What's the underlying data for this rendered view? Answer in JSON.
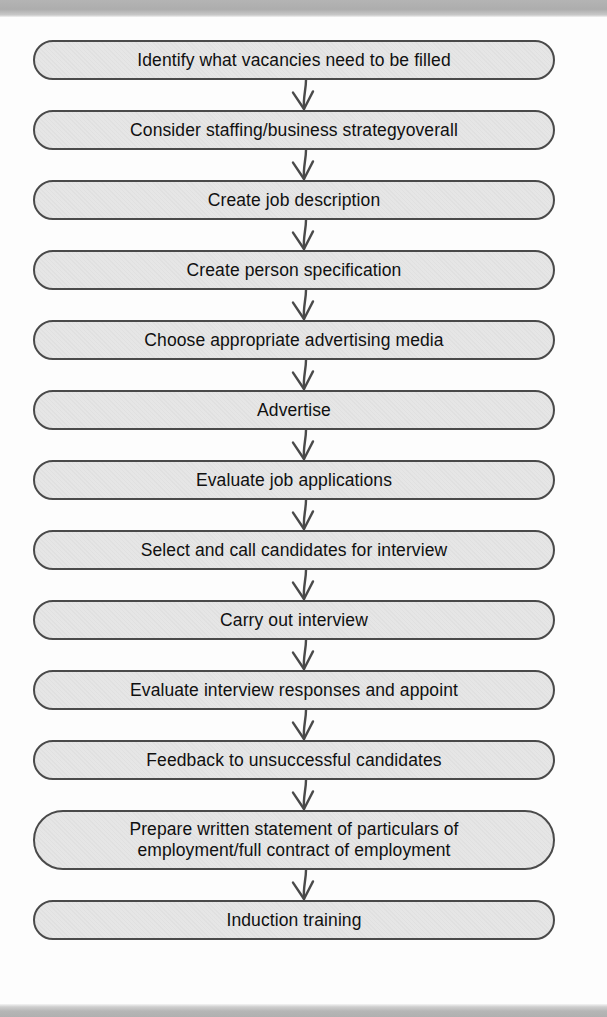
{
  "document": {
    "type": "flowchart",
    "orientation": "vertical-top-to-bottom",
    "title": "Recruitment and selection process flow chart",
    "box_fill_color": "#dcdcdc",
    "box_border_color": "#4a4a4a",
    "text_color": "#101010",
    "connector_color": "#4a4a4a",
    "scan_band_color": "#b0b0b0"
  },
  "chart_data": {
    "type": "diagram",
    "title": "",
    "steps": [
      "Identify what vacancies need to be filled",
      "Consider staffing/business strategyoverall",
      "Create job description",
      "Create person specification",
      "Choose appropriate advertising media",
      "Advertise",
      "Evaluate job applications",
      "Select and call candidates for interview",
      "Carry out interview",
      "Evaluate interview responses and appoint",
      "Feedback to unsuccessful candidates",
      "Prepare written statement of particulars of\nemployment/full contract of employment",
      "Induction training"
    ],
    "connector_count": 12,
    "connector_style": "curved-line-with-open-v-arrowhead"
  },
  "nodes": [
    {
      "id": "step-1",
      "label": "Identify what vacancies need to be filled",
      "top": 23,
      "height": 40
    },
    {
      "id": "step-2",
      "label": "Consider staffing/business strategyoverall",
      "top": 93,
      "height": 40
    },
    {
      "id": "step-3",
      "label": "Create job description",
      "top": 163,
      "height": 40
    },
    {
      "id": "step-4",
      "label": "Create person specification",
      "top": 233,
      "height": 40
    },
    {
      "id": "step-5",
      "label": "Choose appropriate advertising media",
      "top": 303,
      "height": 40
    },
    {
      "id": "step-6",
      "label": "Advertise",
      "top": 373,
      "height": 40
    },
    {
      "id": "step-7",
      "label": "Evaluate job applications",
      "top": 443,
      "height": 40
    },
    {
      "id": "step-8",
      "label": "Select and call candidates for interview",
      "top": 513,
      "height": 40
    },
    {
      "id": "step-9",
      "label": "Carry out interview",
      "top": 583,
      "height": 40
    },
    {
      "id": "step-10",
      "label": "Evaluate interview responses and appoint",
      "top": 653,
      "height": 40
    },
    {
      "id": "step-11",
      "label": "Feedback to unsuccessful candidates",
      "top": 723,
      "height": 40
    },
    {
      "id": "step-12",
      "label": "Prepare written statement of particulars of\nemployment/full contract of employment",
      "top": 793,
      "height": 60
    },
    {
      "id": "step-13",
      "label": "Induction training",
      "top": 883,
      "height": 40
    }
  ],
  "connectors": [
    {
      "id": "arrow-1",
      "top": 63,
      "height": 30
    },
    {
      "id": "arrow-2",
      "top": 133,
      "height": 30
    },
    {
      "id": "arrow-3",
      "top": 203,
      "height": 30
    },
    {
      "id": "arrow-4",
      "top": 273,
      "height": 30
    },
    {
      "id": "arrow-5",
      "top": 343,
      "height": 30
    },
    {
      "id": "arrow-6",
      "top": 413,
      "height": 30
    },
    {
      "id": "arrow-7",
      "top": 483,
      "height": 30
    },
    {
      "id": "arrow-8",
      "top": 553,
      "height": 30
    },
    {
      "id": "arrow-9",
      "top": 623,
      "height": 30
    },
    {
      "id": "arrow-10",
      "top": 693,
      "height": 30
    },
    {
      "id": "arrow-11",
      "top": 763,
      "height": 30
    },
    {
      "id": "arrow-12",
      "top": 853,
      "height": 30
    }
  ]
}
